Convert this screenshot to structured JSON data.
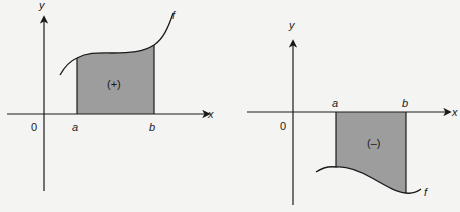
{
  "colors": {
    "background": "#f4f4f2",
    "ink": "#1a1a1a",
    "shade": "#9d9d9d"
  },
  "left_graph": {
    "y_axis_label": "y",
    "x_axis_label": "x",
    "origin_label": "0",
    "lower_bound_label": "a",
    "upper_bound_label": "b",
    "function_label": "f",
    "region_sign_label": "(+)"
  },
  "right_graph": {
    "y_axis_label": "y",
    "x_axis_label": "x",
    "origin_label": "0",
    "lower_bound_label": "a",
    "upper_bound_label": "b",
    "function_label": "f",
    "region_sign_label": "(–)"
  }
}
